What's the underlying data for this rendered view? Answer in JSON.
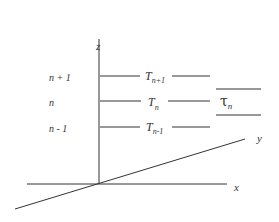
{
  "axes": {
    "z_label": "z",
    "x_label": "x",
    "y_label": "y"
  },
  "levels": [
    {
      "index_label": "n + 1",
      "temp_base": "T",
      "temp_sub": "n+1"
    },
    {
      "index_label": "n",
      "temp_base": "T",
      "temp_sub": "n"
    },
    {
      "index_label": "n - 1",
      "temp_base": "T",
      "temp_sub": "n-1"
    }
  ],
  "interval": {
    "base": "τ",
    "sub": "n"
  },
  "colors": {
    "ink": "#333333",
    "background": "#ffffff"
  }
}
